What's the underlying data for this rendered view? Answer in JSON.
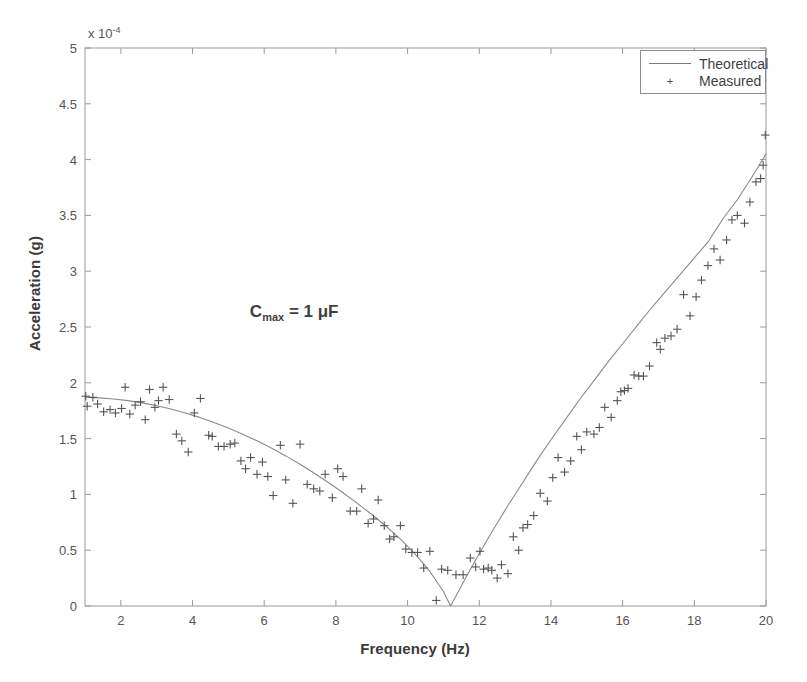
{
  "chart_data": {
    "type": "scatter",
    "title": "",
    "xlabel": "Frequency (Hz)",
    "ylabel": "Acceleration (g)",
    "y_multiplier": "x 10",
    "y_multiplier_exp": "-4",
    "xlim": [
      1,
      20
    ],
    "ylim": [
      0,
      5
    ],
    "xticks": [
      2,
      4,
      6,
      8,
      10,
      12,
      14,
      16,
      18,
      20
    ],
    "yticks": [
      0,
      0.5,
      1,
      1.5,
      2,
      2.5,
      3,
      3.5,
      4,
      4.5,
      5
    ],
    "xtick_labels": [
      "2",
      "4",
      "6",
      "8",
      "10",
      "12",
      "14",
      "16",
      "18",
      "20"
    ],
    "ytick_labels": [
      "0",
      "0.5",
      "1",
      "1.5",
      "2",
      "2.5",
      "3",
      "3.5",
      "4",
      "4.5",
      "5"
    ],
    "grid": false,
    "legend_position": "upper right",
    "annotation": {
      "text_main": "C",
      "text_sub": "max",
      "text_rest": " = 1 μF",
      "x": 5.6,
      "y": 2.62
    },
    "series": [
      {
        "name": "Theoretical",
        "type": "line",
        "color": "#8a8a8a",
        "x": [
          1.0,
          1.4,
          1.8,
          2.2,
          2.6,
          3.0,
          3.4,
          3.8,
          4.2,
          4.6,
          5.0,
          5.4,
          5.8,
          6.2,
          6.6,
          7.0,
          7.4,
          7.8,
          8.2,
          8.6,
          9.0,
          9.4,
          9.8,
          10.2,
          10.6,
          11.0,
          11.2,
          11.6,
          12.0,
          12.4,
          12.8,
          13.2,
          13.6,
          14.0,
          14.4,
          14.8,
          15.2,
          15.6,
          16.0,
          16.4,
          16.8,
          17.2,
          17.6,
          18.0,
          18.4,
          18.8,
          19.2,
          19.6,
          20.0
        ],
        "y": [
          1.87,
          1.865,
          1.855,
          1.84,
          1.82,
          1.795,
          1.765,
          1.73,
          1.69,
          1.645,
          1.595,
          1.54,
          1.48,
          1.415,
          1.345,
          1.27,
          1.19,
          1.105,
          1.015,
          0.92,
          0.82,
          0.715,
          0.6,
          0.47,
          0.32,
          0.13,
          0.0,
          0.24,
          0.47,
          0.69,
          0.9,
          1.1,
          1.3,
          1.49,
          1.67,
          1.85,
          2.02,
          2.19,
          2.35,
          2.51,
          2.67,
          2.82,
          2.97,
          3.12,
          3.27,
          3.47,
          3.64,
          3.84,
          4.05
        ]
      },
      {
        "name": "Measured",
        "type": "scatter",
        "marker": "+",
        "color": "#555555",
        "points": [
          [
            1.02,
            1.88
          ],
          [
            1.06,
            1.79
          ],
          [
            1.22,
            1.87
          ],
          [
            1.35,
            1.81
          ],
          [
            1.52,
            1.74
          ],
          [
            1.7,
            1.76
          ],
          [
            1.85,
            1.73
          ],
          [
            2.02,
            1.77
          ],
          [
            2.12,
            1.96
          ],
          [
            2.25,
            1.72
          ],
          [
            2.4,
            1.8
          ],
          [
            2.55,
            1.83
          ],
          [
            2.68,
            1.67
          ],
          [
            2.8,
            1.94
          ],
          [
            2.95,
            1.78
          ],
          [
            3.05,
            1.84
          ],
          [
            3.18,
            1.96
          ],
          [
            3.35,
            1.85
          ],
          [
            3.55,
            1.54
          ],
          [
            3.7,
            1.48
          ],
          [
            3.88,
            1.38
          ],
          [
            4.05,
            1.73
          ],
          [
            4.22,
            1.86
          ],
          [
            4.45,
            1.53
          ],
          [
            4.55,
            1.52
          ],
          [
            4.72,
            1.43
          ],
          [
            4.88,
            1.43
          ],
          [
            5.05,
            1.45
          ],
          [
            5.18,
            1.46
          ],
          [
            5.35,
            1.3
          ],
          [
            5.48,
            1.23
          ],
          [
            5.62,
            1.33
          ],
          [
            5.8,
            1.18
          ],
          [
            5.95,
            1.29
          ],
          [
            6.1,
            1.16
          ],
          [
            6.25,
            0.99
          ],
          [
            6.45,
            1.44
          ],
          [
            6.6,
            1.13
          ],
          [
            6.8,
            0.92
          ],
          [
            7.0,
            1.45
          ],
          [
            7.2,
            1.09
          ],
          [
            7.38,
            1.05
          ],
          [
            7.55,
            1.03
          ],
          [
            7.7,
            1.18
          ],
          [
            7.9,
            0.97
          ],
          [
            8.05,
            1.23
          ],
          [
            8.2,
            1.16
          ],
          [
            8.4,
            0.85
          ],
          [
            8.58,
            0.85
          ],
          [
            8.72,
            1.05
          ],
          [
            8.9,
            0.74
          ],
          [
            9.05,
            0.78
          ],
          [
            9.18,
            0.95
          ],
          [
            9.35,
            0.72
          ],
          [
            9.5,
            0.6
          ],
          [
            9.62,
            0.62
          ],
          [
            9.8,
            0.72
          ],
          [
            9.95,
            0.51
          ],
          [
            10.12,
            0.48
          ],
          [
            10.28,
            0.48
          ],
          [
            10.45,
            0.34
          ],
          [
            10.62,
            0.49
          ],
          [
            10.8,
            0.05
          ],
          [
            10.95,
            0.33
          ],
          [
            11.12,
            0.32
          ],
          [
            11.35,
            0.28
          ],
          [
            11.55,
            0.28
          ],
          [
            11.75,
            0.43
          ],
          [
            11.9,
            0.35
          ],
          [
            12.02,
            0.49
          ],
          [
            12.12,
            0.33
          ],
          [
            12.25,
            0.34
          ],
          [
            12.35,
            0.32
          ],
          [
            12.5,
            0.25
          ],
          [
            12.62,
            0.37
          ],
          [
            12.8,
            0.29
          ],
          [
            12.95,
            0.62
          ],
          [
            13.1,
            0.5
          ],
          [
            13.22,
            0.7
          ],
          [
            13.35,
            0.73
          ],
          [
            13.52,
            0.81
          ],
          [
            13.7,
            1.01
          ],
          [
            13.9,
            0.94
          ],
          [
            14.05,
            1.15
          ],
          [
            14.2,
            1.33
          ],
          [
            14.38,
            1.2
          ],
          [
            14.55,
            1.3
          ],
          [
            14.72,
            1.52
          ],
          [
            14.85,
            1.4
          ],
          [
            15.0,
            1.56
          ],
          [
            15.2,
            1.54
          ],
          [
            15.35,
            1.6
          ],
          [
            15.5,
            1.78
          ],
          [
            15.68,
            1.69
          ],
          [
            15.85,
            1.84
          ],
          [
            15.95,
            1.92
          ],
          [
            16.05,
            1.93
          ],
          [
            16.15,
            1.95
          ],
          [
            16.32,
            2.07
          ],
          [
            16.45,
            2.06
          ],
          [
            16.58,
            2.06
          ],
          [
            16.75,
            2.15
          ],
          [
            16.95,
            2.36
          ],
          [
            17.05,
            2.3
          ],
          [
            17.18,
            2.4
          ],
          [
            17.35,
            2.42
          ],
          [
            17.52,
            2.48
          ],
          [
            17.7,
            2.79
          ],
          [
            17.88,
            2.6
          ],
          [
            18.05,
            2.77
          ],
          [
            18.2,
            2.92
          ],
          [
            18.38,
            3.05
          ],
          [
            18.55,
            3.2
          ],
          [
            18.72,
            3.1
          ],
          [
            18.9,
            3.28
          ],
          [
            19.05,
            3.46
          ],
          [
            19.2,
            3.5
          ],
          [
            19.4,
            3.43
          ],
          [
            19.55,
            3.62
          ],
          [
            19.72,
            3.8
          ],
          [
            19.85,
            3.83
          ],
          [
            19.92,
            3.95
          ],
          [
            19.98,
            4.22
          ]
        ]
      }
    ]
  },
  "legend": {
    "items": [
      {
        "label": "Theoretical",
        "style": "line"
      },
      {
        "label": "Measured",
        "style": "marker"
      }
    ]
  },
  "axes": {
    "x_title": "Frequency (Hz)",
    "y_title": "Acceleration (g)"
  }
}
